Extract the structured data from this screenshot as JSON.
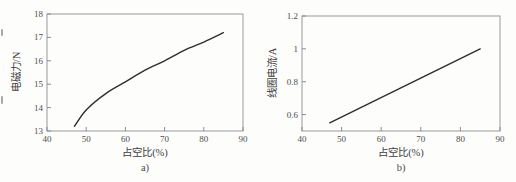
{
  "figure": {
    "background": "#fdfdfc"
  },
  "colors": {
    "series_line": "#2e2e30",
    "axis_box": "#9a9aa0",
    "tick_mark": "#8a8a90",
    "tick_label": "#4e4e50",
    "axis_label": "#3d3d3f",
    "caption": "#4a4a4c"
  },
  "chart_data": [
    {
      "id": "a",
      "type": "line",
      "title": "",
      "xlabel": "占空比(%)",
      "ylabel": "电磁力/N",
      "caption": "a)",
      "xlim": [
        40,
        90
      ],
      "ylim": [
        13,
        18
      ],
      "xticks": [
        40,
        50,
        60,
        70,
        80,
        90
      ],
      "xtick_labels": [
        "40",
        "50",
        "60",
        "70",
        "80",
        "90"
      ],
      "yticks": [
        13,
        14,
        15,
        16,
        17,
        18
      ],
      "ytick_labels": [
        "13",
        "14",
        "15",
        "16",
        "17",
        "18"
      ],
      "grid": false,
      "legend": null,
      "series": [
        {
          "name": "电磁力",
          "smooth": true,
          "x": [
            47,
            50,
            55,
            60,
            65,
            70,
            75,
            80,
            85
          ],
          "y": [
            13.2,
            13.9,
            14.6,
            15.1,
            15.6,
            16.0,
            16.45,
            16.8,
            17.2
          ]
        }
      ]
    },
    {
      "id": "b",
      "type": "line",
      "title": "",
      "xlabel": "占空比(%)",
      "ylabel": "线圈电流/A",
      "caption": "b)",
      "xlim": [
        40,
        90
      ],
      "ylim": [
        0.5,
        1.2
      ],
      "xticks": [
        40,
        50,
        60,
        70,
        80,
        90
      ],
      "xtick_labels": [
        "40",
        "50",
        "60",
        "70",
        "80",
        "90"
      ],
      "yticks": [
        0.6,
        0.8,
        1,
        1.2
      ],
      "ytick_labels": [
        "0.6",
        "0.8",
        "1",
        "1.2"
      ],
      "grid": false,
      "legend": null,
      "series": [
        {
          "name": "线圈电流",
          "smooth": false,
          "x": [
            47,
            85
          ],
          "y": [
            0.55,
            1.0
          ]
        }
      ]
    }
  ]
}
